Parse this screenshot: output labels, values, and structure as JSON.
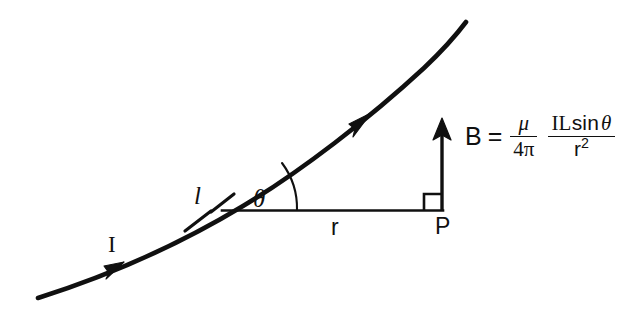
{
  "diagram": {
    "background_color": "#ffffff",
    "ink_color": "#101010",
    "labels": {
      "current": "I",
      "length_element": "l",
      "angle": "θ",
      "distance": "r",
      "point": "P",
      "field": "B"
    },
    "equation": {
      "lhs": "B",
      "equals": "=",
      "constant_fraction": {
        "numerator": "μ",
        "denominator": "4π"
      },
      "main_fraction": {
        "numerator_parts": {
          "current": "I",
          "length": "L",
          "sin": "sin",
          "angle": "θ"
        },
        "numerator": "IL sin θ",
        "denominator_base": "r",
        "denominator_exponent": "2",
        "denominator": "r2"
      },
      "full_text": "B = (μ / 4π) (IL sin θ / r²)"
    },
    "elements": {
      "wire_label": "current-carrying wire",
      "arrowhead_count": 2,
      "tick_mark_count": 2,
      "right_angle_marker": true,
      "angle_arc": true
    }
  }
}
